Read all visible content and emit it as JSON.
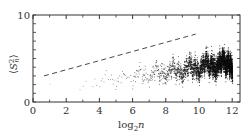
{
  "chart_data": {
    "type": "scatter",
    "title": "",
    "xlabel": "log2 n",
    "xlabel_parts": {
      "base": "log",
      "sub": "2",
      "var": "n"
    },
    "ylabel": "⟨S_n^2⟩",
    "ylabel_parts": {
      "open": "⟨",
      "var": "S",
      "sup": "2",
      "sub": "n",
      "close": "⟩"
    },
    "xlim": [
      0,
      12.5
    ],
    "ylim": [
      0,
      10
    ],
    "xticks": [
      0,
      2,
      4,
      6,
      8,
      10,
      12
    ],
    "xticks_minor": [
      1,
      3,
      5,
      7,
      9,
      11
    ],
    "yticks_labeled": [
      0,
      10
    ],
    "yticks": [
      0,
      1,
      2,
      3,
      4,
      5,
      6,
      7,
      8,
      9,
      10
    ],
    "grid": false,
    "legend": null,
    "series": [
      {
        "name": "data points",
        "style": "dots",
        "color": "#222222",
        "description": "Dense fractal-like point cloud; upper envelope grows roughly linearly with log2 n, density increases toward larger n",
        "envelope_samples": [
          {
            "x": 1,
            "y_max": 2.2
          },
          {
            "x": 2,
            "y_max": 2.7
          },
          {
            "x": 3,
            "y_max": 3.1
          },
          {
            "x": 4,
            "y_max": 3.6
          },
          {
            "x": 5,
            "y_max": 4.1
          },
          {
            "x": 6,
            "y_max": 4.6
          },
          {
            "x": 7,
            "y_max": 5.1
          },
          {
            "x": 8,
            "y_max": 5.6
          },
          {
            "x": 9,
            "y_max": 6.0
          },
          {
            "x": 10,
            "y_max": 6.6
          },
          {
            "x": 11,
            "y_max": 7.1
          },
          {
            "x": 12,
            "y_max": 7.3
          }
        ]
      },
      {
        "name": "reference line",
        "style": "dashed",
        "color": "#333333",
        "x": [
          0.66,
          9.8
        ],
        "y": [
          3.0,
          7.8
        ]
      }
    ]
  }
}
